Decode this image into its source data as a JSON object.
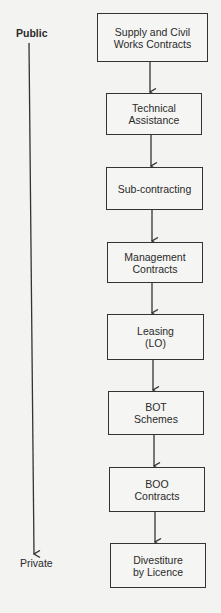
{
  "axis": {
    "top_label": "Public",
    "bottom_label": "Private"
  },
  "boxes": [
    {
      "label": "Supply and Civil\nWorks Contracts",
      "x": 97,
      "y": 13,
      "w": 111,
      "h": 49
    },
    {
      "label": "Technical\nAssistance",
      "x": 106,
      "y": 93,
      "w": 96,
      "h": 42
    },
    {
      "label": "Sub-contracting",
      "x": 106,
      "y": 167,
      "w": 97,
      "h": 43
    },
    {
      "label": "Management\nContracts",
      "x": 107,
      "y": 242,
      "w": 96,
      "h": 41
    },
    {
      "label": "Leasing\n(LO)",
      "x": 107,
      "y": 314,
      "w": 97,
      "h": 46
    },
    {
      "label": "BOT\nSchemes",
      "x": 108,
      "y": 391,
      "w": 96,
      "h": 44
    },
    {
      "label": "BOO\nContracts",
      "x": 109,
      "y": 467,
      "w": 96,
      "h": 45
    },
    {
      "label": "Divestiture\nby Licence",
      "x": 110,
      "y": 543,
      "w": 96,
      "h": 45
    }
  ],
  "colors": {
    "background": "#f3f3f1",
    "line": "#333333"
  }
}
